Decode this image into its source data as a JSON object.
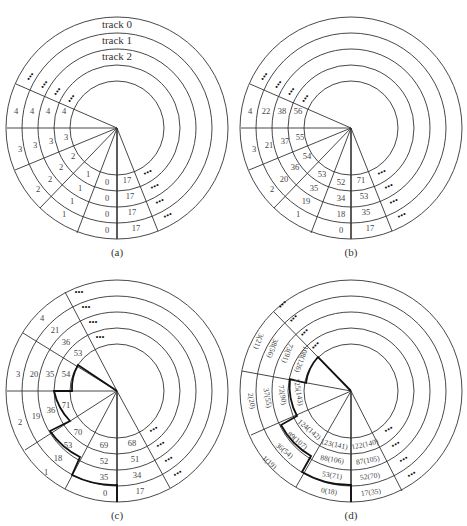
{
  "figure": {
    "panels": [
      {
        "id": "a",
        "caption": "(a)",
        "track_labels": [
          "track 0",
          "track 1",
          "track 2"
        ],
        "sectors_left": [
          {
            "name": "0",
            "cells": [
              "0",
              "0",
              "0",
              "0"
            ]
          },
          {
            "name": "1",
            "cells": [
              "1",
              "1",
              "1",
              "1"
            ]
          },
          {
            "name": "2",
            "cells": [
              "2",
              "2",
              "2",
              "2"
            ]
          },
          {
            "name": "3",
            "cells": [
              "3",
              "3",
              "3",
              "3"
            ]
          },
          {
            "name": "4",
            "cells": [
              "4",
              "4",
              "4",
              "4"
            ]
          }
        ],
        "sector_right": {
          "cells": [
            "17",
            "17",
            "17",
            "17"
          ]
        },
        "ellipsis": "•••"
      },
      {
        "id": "b",
        "caption": "(b)",
        "sectors_left": [
          {
            "cells": [
              "0",
              "18",
              "34",
              "52"
            ]
          },
          {
            "cells": [
              "1",
              "19",
              "35",
              "53"
            ]
          },
          {
            "cells": [
              "2",
              "20",
              "36",
              "54"
            ]
          },
          {
            "cells": [
              "3",
              "21",
              "37",
              "55"
            ]
          },
          {
            "cells": [
              "4",
              "22",
              "38",
              "56"
            ]
          }
        ],
        "sector_right": {
          "cells": [
            "17",
            "35",
            "53",
            "71"
          ]
        },
        "ellipsis": "•••"
      },
      {
        "id": "c",
        "caption": "(c)",
        "sectors_left": [
          {
            "cells": [
              "0",
              "35",
              "52",
              "69"
            ]
          },
          {
            "cells": [
              "1",
              "18",
              "53",
              "70"
            ]
          },
          {
            "cells": [
              "2",
              "19",
              "36",
              "71"
            ]
          },
          {
            "cells": [
              "3",
              "20",
              "35",
              "54"
            ]
          },
          {
            "cells": [
              "4",
              "21",
              "36",
              "53"
            ]
          }
        ],
        "sector_right": {
          "cells": [
            "17",
            "34",
            "51",
            "68"
          ]
        },
        "ellipsis": "•••"
      },
      {
        "id": "d",
        "caption": "(d)",
        "sectors_left": [
          {
            "cells": [
              "0(18)",
              "53(71)",
              "88(106)",
              "123(141)"
            ]
          },
          {
            "cells": [
              "1(19)",
              "36(54)",
              "89(107)",
              "124(142)"
            ]
          },
          {
            "cells": [
              "2(20)",
              "37(55)",
              "72(90)",
              "125(143)"
            ]
          },
          {
            "cells": [
              "3(21)",
              "38(56)",
              "73(91)",
              "108(126)"
            ]
          }
        ],
        "sector_right": {
          "cells": [
            "17(35)",
            "52(70)",
            "87(105)",
            "122(140)"
          ]
        },
        "ellipsis": "•••"
      }
    ]
  }
}
